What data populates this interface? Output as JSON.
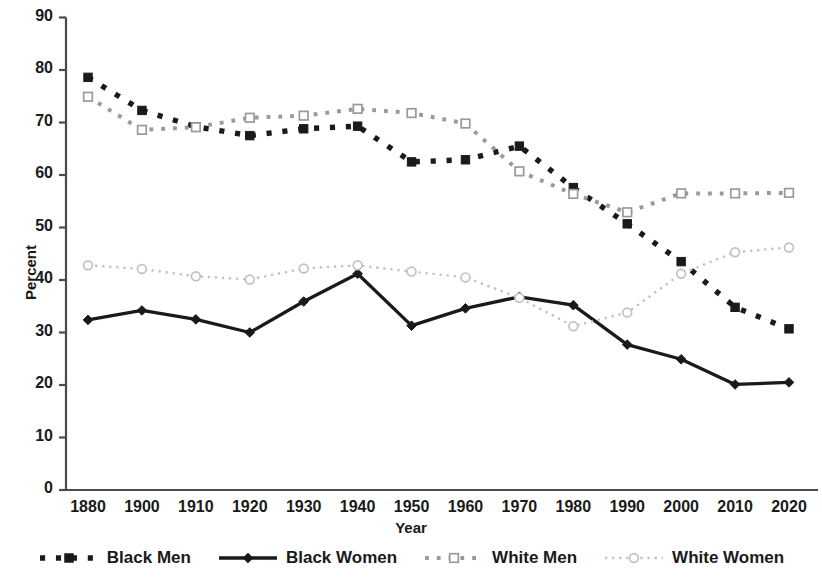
{
  "chart_data": {
    "type": "line",
    "title": "",
    "xlabel": "Year",
    "ylabel": "Percent",
    "ylim": [
      0,
      90
    ],
    "yticks": [
      0,
      10,
      20,
      30,
      40,
      50,
      60,
      70,
      80,
      90
    ],
    "grid": false,
    "legend_position": "bottom",
    "categories": [
      "1880",
      "1900",
      "1910",
      "1920",
      "1930",
      "1940",
      "1950",
      "1960",
      "1970",
      "1980",
      "1990",
      "2000",
      "2010",
      "2020"
    ],
    "series": [
      {
        "name": "Black Men",
        "color": "#1a1a1a",
        "line_style": "dotted",
        "marker": "filled-square",
        "values": [
          78.6,
          72.3,
          69.2,
          67.5,
          68.8,
          69.3,
          62.5,
          62.9,
          65.5,
          57.6,
          50.7,
          43.5,
          34.8,
          30.7
        ]
      },
      {
        "name": "Black Women",
        "color": "#1a1a1a",
        "line_style": "solid",
        "marker": "filled-diamond",
        "values": [
          32.4,
          34.2,
          32.5,
          30.0,
          35.9,
          41.2,
          31.3,
          34.6,
          36.8,
          35.2,
          27.7,
          24.9,
          20.1,
          20.5
        ]
      },
      {
        "name": "White Men",
        "color": "#9a9a9a",
        "line_style": "dotted",
        "marker": "open-square",
        "values": [
          74.9,
          68.6,
          69.1,
          70.9,
          71.3,
          72.6,
          71.8,
          69.8,
          60.7,
          56.4,
          52.9,
          56.5,
          56.5,
          56.6
        ]
      },
      {
        "name": "White Women",
        "color": "#c2c2c2",
        "line_style": "dotted",
        "marker": "open-circle",
        "values": [
          42.8,
          42.1,
          40.7,
          40.1,
          42.2,
          42.8,
          41.6,
          40.5,
          36.6,
          31.2,
          33.8,
          41.2,
          45.3,
          46.2
        ]
      }
    ]
  },
  "axis": {
    "y_title": "Percent",
    "x_title": "Year"
  },
  "legend": {
    "items": [
      {
        "label": "Black Men"
      },
      {
        "label": "Black Women"
      },
      {
        "label": "White Men"
      },
      {
        "label": "White Women"
      }
    ]
  }
}
